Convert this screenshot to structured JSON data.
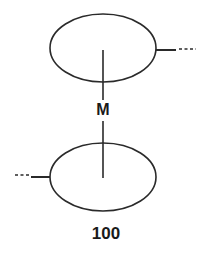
{
  "diagram": {
    "type": "patent-style schematic",
    "stroke_color": "#2a2a2a",
    "top_ellipse": {
      "cx": 103,
      "cy": 48,
      "rx": 53,
      "ry": 34
    },
    "bottom_ellipse": {
      "cx": 103,
      "cy": 177,
      "rx": 53,
      "ry": 34
    },
    "connector_label": "M",
    "reference_numeral": "100",
    "right_stub": "solid line then dashes (continuation) from top ellipse",
    "left_stub": "dashes then solid line (continuation) into bottom ellipse"
  }
}
